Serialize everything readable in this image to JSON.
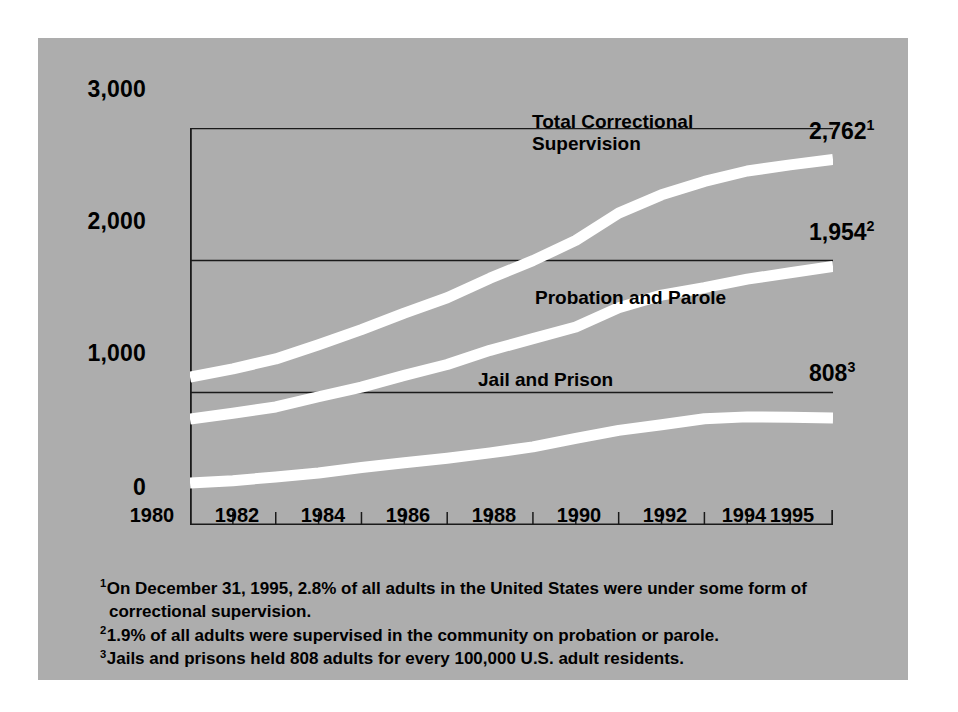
{
  "chart_data": {
    "type": "line",
    "title": "",
    "subtitle": "",
    "xlabel": "",
    "ylabel": "",
    "xlim": [
      1980,
      1995
    ],
    "ylim": [
      0,
      3000
    ],
    "grid": true,
    "legend_position": "inline-labels",
    "background_color": "#adadad",
    "line_color": "#ffffff",
    "axis_color": "#000000",
    "x": [
      1980,
      1981,
      1982,
      1983,
      1984,
      1985,
      1986,
      1987,
      1988,
      1989,
      1990,
      1991,
      1992,
      1993,
      1994,
      1995
    ],
    "y_ticks": [
      0,
      1000,
      2000,
      3000
    ],
    "y_tick_labels": [
      "0",
      "1,000",
      "2,000",
      "3,000"
    ],
    "x_tick_labels": [
      "1980",
      "1982",
      "1984",
      "1986",
      "1988",
      "1990",
      "1992",
      "1994",
      "1995"
    ],
    "x_tick_values": [
      1980,
      1982,
      1984,
      1986,
      1988,
      1990,
      1992,
      1994,
      1995
    ],
    "series": [
      {
        "name": "Total Correctional Supervision",
        "label": "Total Correctional\nSupervision",
        "end_value": "2,762",
        "end_footnote": "1",
        "values": [
          1118,
          1180,
          1255,
          1362,
          1476,
          1601,
          1717,
          1865,
          1998,
          2151,
          2357,
          2495,
          2596,
          2675,
          2721,
          2762
        ]
      },
      {
        "name": "Probation and Parole",
        "label": "Probation and Parole",
        "end_value": "1,954",
        "end_footnote": "2",
        "values": [
          800,
          845,
          892,
          969,
          1042,
          1131,
          1213,
          1320,
          1408,
          1496,
          1642,
          1737,
          1793,
          1858,
          1906,
          1954
        ]
      },
      {
        "name": "Jail and Prison",
        "label": "Jail and Prison",
        "end_value": "808",
        "end_footnote": "3",
        "values": [
          318,
          335,
          363,
          393,
          434,
          470,
          504,
          545,
          590,
          655,
          715,
          758,
          803,
          817,
          815,
          808
        ]
      }
    ],
    "annotations": [
      "Total Correctional Supervision",
      "Probation and Parole",
      "Jail and Prison"
    ]
  },
  "footnotes": [
    {
      "marker": "1",
      "line1": "On December 31, 1995, 2.8% of all adults in the United States were under some form of",
      "line2": "correctional supervision."
    },
    {
      "marker": "2",
      "line1": "1.9% of all adults were supervised in the community on probation or parole.",
      "line2": ""
    },
    {
      "marker": "3",
      "line1": "Jails and prisons held 808 adults for every 100,000 U.S. adult residents.",
      "line2": ""
    }
  ]
}
